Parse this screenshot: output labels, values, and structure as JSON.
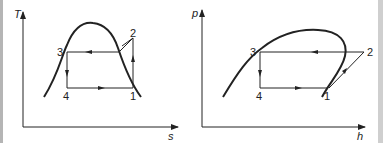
{
  "diagrams": [
    {
      "name": "T-s diagram",
      "y_axis_label": "T",
      "x_axis_label": "s",
      "points": {
        "p1": "1",
        "p2": "2",
        "p3": "3",
        "p4": "4"
      }
    },
    {
      "name": "p-h diagram",
      "y_axis_label": "p",
      "x_axis_label": "h",
      "points": {
        "p1": "1",
        "p2": "2",
        "p3": "3",
        "p4": "4"
      }
    }
  ],
  "colors": {
    "line": "#222222",
    "border": "#b5b5b5"
  }
}
